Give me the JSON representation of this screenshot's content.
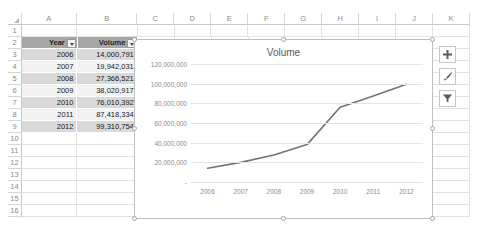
{
  "spreadsheet": {
    "column_headers": [
      "A",
      "B",
      "C",
      "D",
      "E",
      "F",
      "G",
      "H",
      "I",
      "J",
      "K"
    ],
    "row_headers": [
      "1",
      "2",
      "3",
      "4",
      "5",
      "6",
      "7",
      "8",
      "9",
      "10",
      "11",
      "12",
      "13",
      "14",
      "15",
      "16"
    ],
    "select_all_icon": "select-all-triangle"
  },
  "table": {
    "headers": [
      {
        "label": "Year",
        "filter_icon": "filter-dropdown-icon"
      },
      {
        "label": "Volume",
        "filter_icon": "filter-dropdown-icon"
      }
    ],
    "rows": [
      {
        "year": "2006",
        "volume": "14,000,791"
      },
      {
        "year": "2007",
        "volume": "19,942,031"
      },
      {
        "year": "2008",
        "volume": "27,366,521"
      },
      {
        "year": "2009",
        "volume": "38,020,917"
      },
      {
        "year": "2010",
        "volume": "76,010,392"
      },
      {
        "year": "2011",
        "volume": "87,418,334"
      },
      {
        "year": "2012",
        "volume": "99,310,754"
      }
    ]
  },
  "chart_buttons": [
    {
      "name": "chart-elements-button",
      "icon": "plus-icon"
    },
    {
      "name": "chart-styles-button",
      "icon": "paintbrush-icon"
    },
    {
      "name": "chart-filters-button",
      "icon": "funnel-icon"
    }
  ],
  "chart_data": {
    "type": "line",
    "title": "Volume",
    "xlabel": "",
    "ylabel": "",
    "categories": [
      "2006",
      "2007",
      "2008",
      "2009",
      "2010",
      "2011",
      "2012"
    ],
    "values": [
      14000791,
      19942031,
      27366521,
      38020917,
      76010392,
      87418334,
      99310754
    ],
    "series": [
      {
        "name": "Volume",
        "values": [
          14000791,
          19942031,
          27366521,
          38020917,
          76010392,
          87418334,
          99310754
        ]
      }
    ],
    "ylim": [
      0,
      120000000
    ],
    "ytick_values": [
      0,
      20000000,
      40000000,
      60000000,
      80000000,
      100000000,
      120000000
    ],
    "ytick_labels": [
      "-",
      "20,000,000",
      "40,000,000",
      "60,000,000",
      "80,000,000",
      "100,000,000",
      "120,000,000"
    ],
    "grid": true,
    "legend": "none",
    "line_color": "#737373"
  }
}
